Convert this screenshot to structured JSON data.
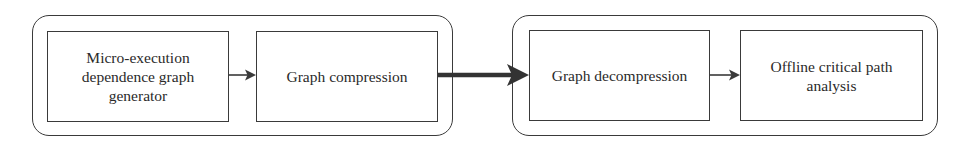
{
  "diagram": {
    "groups": [
      {
        "id": "online",
        "nodes": [
          "Micro-execution dependence graph generator",
          "Graph compression"
        ]
      },
      {
        "id": "offline",
        "nodes": [
          "Graph decompression",
          "Offline critical path analysis"
        ]
      }
    ],
    "nodes": {
      "n1": {
        "label_lines": [
          "Micro-execution",
          "dependence graph",
          "generator"
        ]
      },
      "n2": {
        "label": "Graph compression"
      },
      "n3": {
        "label": "Graph decompression"
      },
      "n4": {
        "label_lines": [
          "Offline critical path",
          "analysis"
        ]
      }
    },
    "edges": [
      {
        "from": "n1",
        "to": "n2",
        "style": "thin"
      },
      {
        "from": "n2",
        "to": "n3",
        "style": "thick"
      },
      {
        "from": "n3",
        "to": "n4",
        "style": "thin"
      }
    ],
    "colors": {
      "stroke": "#3a3a3a",
      "text": "#2a2a2a",
      "background": "#ffffff"
    }
  }
}
